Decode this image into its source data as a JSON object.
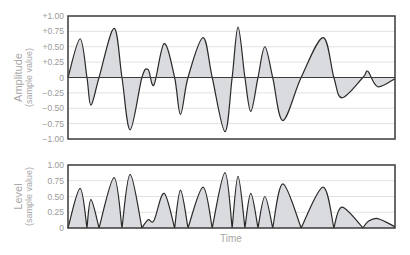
{
  "chart_data": [
    {
      "type": "area",
      "title": "",
      "ylabel": "Amplitude",
      "ylabel_sub": "(sample value)",
      "xlabel": "",
      "ylim": [
        -1.0,
        1.0
      ],
      "xlim": [
        0,
        1
      ],
      "grid": true,
      "yticks": [
        "+1.00",
        "+0.75",
        "+0.50",
        "+0.25",
        "0",
        "−0.25",
        "−0.50",
        "−0.75",
        "−1.00"
      ],
      "ytick_values": [
        1.0,
        0.75,
        0.5,
        0.25,
        0,
        -0.25,
        -0.5,
        -0.75,
        -1.0
      ],
      "series": [
        {
          "name": "amplitude",
          "x": [
            0,
            0.037,
            0.058,
            0.07,
            0.095,
            0.141,
            0.165,
            0.19,
            0.226,
            0.245,
            0.263,
            0.294,
            0.326,
            0.344,
            0.367,
            0.413,
            0.441,
            0.48,
            0.502,
            0.52,
            0.541,
            0.559,
            0.581,
            0.602,
            0.626,
            0.657,
            0.713,
            0.78,
            0.813,
            0.838,
            0.902,
            0.917,
            0.947,
            1.0
          ],
          "values": [
            0,
            0.63,
            0,
            -0.45,
            0,
            0.8,
            0,
            -0.85,
            0,
            0.13,
            -0.12,
            0.55,
            0,
            -0.6,
            0,
            0.65,
            0,
            -0.88,
            0,
            0.82,
            0,
            -0.55,
            0,
            0.5,
            0,
            -0.7,
            0,
            0.65,
            0,
            -0.33,
            0,
            0.1,
            -0.15,
            -0.02
          ]
        }
      ]
    },
    {
      "type": "area",
      "title": "",
      "ylabel": "Level",
      "ylabel_sub": "(sample value)",
      "xlabel": "Time",
      "ylim": [
        0,
        1.0
      ],
      "xlim": [
        0,
        1
      ],
      "grid": true,
      "yticks": [
        "1.00",
        "0.75",
        "0.50",
        "0.25",
        "0"
      ],
      "ytick_values": [
        1.0,
        0.75,
        0.5,
        0.25,
        0
      ],
      "series": [
        {
          "name": "level",
          "derived_from": "abs(amplitude)",
          "x": [
            0,
            0.037,
            0.058,
            0.07,
            0.095,
            0.141,
            0.165,
            0.19,
            0.226,
            0.245,
            0.263,
            0.294,
            0.326,
            0.344,
            0.367,
            0.413,
            0.441,
            0.48,
            0.502,
            0.52,
            0.541,
            0.559,
            0.581,
            0.602,
            0.626,
            0.657,
            0.713,
            0.78,
            0.813,
            0.838,
            0.902,
            0.917,
            0.947,
            1.0
          ],
          "values": [
            0,
            0.63,
            0,
            0.45,
            0,
            0.8,
            0,
            0.85,
            0,
            0.13,
            0.12,
            0.55,
            0,
            0.6,
            0,
            0.65,
            0,
            0.88,
            0,
            0.82,
            0,
            0.55,
            0,
            0.5,
            0,
            0.7,
            0,
            0.65,
            0,
            0.33,
            0,
            0.1,
            0.15,
            0.02
          ]
        }
      ]
    }
  ],
  "colors": {
    "fill": "#d9dbde",
    "line": "#2a2a2a",
    "frame": "#3a3a3a",
    "grid": "#e2e2e2",
    "text": "#9a9a9a"
  }
}
